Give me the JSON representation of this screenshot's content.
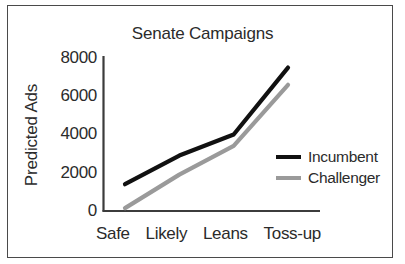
{
  "chart_data": {
    "type": "line",
    "title": "Senate Campaigns",
    "xlabel": "",
    "ylabel": "Predicted Ads",
    "categories": [
      "Safe",
      "Likely",
      "Leans",
      "Toss-up"
    ],
    "ylim": [
      0,
      8000
    ],
    "yticks": [
      "0",
      "2000",
      "4000",
      "6000",
      "8000"
    ],
    "ytick_values": [
      0,
      2000,
      4000,
      6000,
      8000
    ],
    "grid": false,
    "legend_position": "center-right",
    "series": [
      {
        "name": "Incumbent",
        "color": "#111111",
        "values": [
          1400,
          2900,
          4000,
          7500
        ]
      },
      {
        "name": "Challenger",
        "color": "#9a9a9a",
        "values": [
          150,
          1900,
          3400,
          6600
        ]
      }
    ]
  },
  "colors": {
    "incumbent": "#111111",
    "challenger": "#9a9a9a",
    "axis": "#3c3c3c",
    "frame": "#4a4a4a",
    "text": "#2b2b2b"
  }
}
